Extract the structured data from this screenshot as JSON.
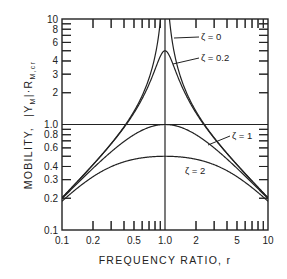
{
  "chart_data": {
    "type": "line",
    "title": "",
    "xlabel": "FREQUENCY RATIO, r",
    "ylabel_main": "MOBILITY,",
    "ylabel_symbol": "|Y",
    "ylabel_sub1": "M",
    "ylabel_mid": "|·R",
    "ylabel_sub2": "M,cr",
    "xscale": "log",
    "yscale": "log",
    "xlim": [
      0.1,
      10
    ],
    "ylim": [
      0.1,
      10
    ],
    "grid": false,
    "reference_lines": [
      {
        "orientation": "vertical",
        "value": 1.0
      },
      {
        "orientation": "horizontal",
        "value": 1.0
      }
    ],
    "x_tick_labels": [
      {
        "value": 0.1,
        "label": "0.1"
      },
      {
        "value": 0.2,
        "label": "0.2"
      },
      {
        "value": 0.5,
        "label": "0.5"
      },
      {
        "value": 1.0,
        "label": "1.0"
      },
      {
        "value": 2,
        "label": "2"
      },
      {
        "value": 5,
        "label": "5"
      },
      {
        "value": 10,
        "label": "10"
      }
    ],
    "y_tick_labels": [
      {
        "value": 0.1,
        "label": "0.1"
      },
      {
        "value": 0.2,
        "label": "0.2"
      },
      {
        "value": 0.3,
        "label": "0.3"
      },
      {
        "value": 0.4,
        "label": "0.4"
      },
      {
        "value": 0.6,
        "label": "0.6"
      },
      {
        "value": 0.8,
        "label": "0.8"
      },
      {
        "value": 1.0,
        "label": "1.0"
      },
      {
        "value": 2,
        "label": "2"
      },
      {
        "value": 3,
        "label": "3"
      },
      {
        "value": 4,
        "label": "4"
      },
      {
        "value": 6,
        "label": "6"
      },
      {
        "value": 8,
        "label": "8"
      },
      {
        "value": 10,
        "label": "10"
      }
    ],
    "minor_ticks": [
      0.2,
      0.3,
      0.4,
      0.5,
      0.6,
      0.7,
      0.8,
      0.9,
      2,
      3,
      4,
      5,
      6,
      7,
      8,
      9
    ],
    "series": [
      {
        "name": "ζ = 0",
        "zeta": 0,
        "points": [
          [
            0.1,
            0.2
          ],
          [
            0.2,
            0.42
          ],
          [
            0.5,
            1.33
          ],
          [
            0.8,
            4.44
          ],
          [
            0.9,
            9.5
          ],
          [
            1.1,
            10.5
          ],
          [
            1.25,
            4.44
          ],
          [
            2,
            1.33
          ],
          [
            5,
            0.42
          ],
          [
            10,
            0.2
          ]
        ]
      },
      {
        "name": "ζ = 0.2",
        "zeta": 0.2,
        "points": [
          [
            0.1,
            0.2
          ],
          [
            0.2,
            0.42
          ],
          [
            0.5,
            1.29
          ],
          [
            0.8,
            3.35
          ],
          [
            1.0,
            5.0
          ],
          [
            1.25,
            3.35
          ],
          [
            2,
            1.29
          ],
          [
            5,
            0.42
          ],
          [
            10,
            0.2
          ]
        ]
      },
      {
        "name": "ζ = 1",
        "zeta": 1,
        "points": [
          [
            0.1,
            0.2
          ],
          [
            0.2,
            0.38
          ],
          [
            0.5,
            0.8
          ],
          [
            1.0,
            1.0
          ],
          [
            2,
            0.8
          ],
          [
            5,
            0.38
          ],
          [
            10,
            0.2
          ]
        ]
      },
      {
        "name": "ζ = 2",
        "zeta": 2,
        "points": [
          [
            0.1,
            0.19
          ],
          [
            0.2,
            0.33
          ],
          [
            0.5,
            0.47
          ],
          [
            1.0,
            0.5
          ],
          [
            2,
            0.47
          ],
          [
            5,
            0.33
          ],
          [
            10,
            0.19
          ]
        ]
      }
    ],
    "annotations": [
      {
        "label": "ζ = 0",
        "series": "ζ = 0"
      },
      {
        "label": "ζ = 0.2",
        "series": "ζ = 0.2"
      },
      {
        "label": "ζ = 1",
        "series": "ζ = 1"
      },
      {
        "label": "ζ = 2",
        "series": "ζ = 2"
      }
    ],
    "line_color": "#222222"
  }
}
